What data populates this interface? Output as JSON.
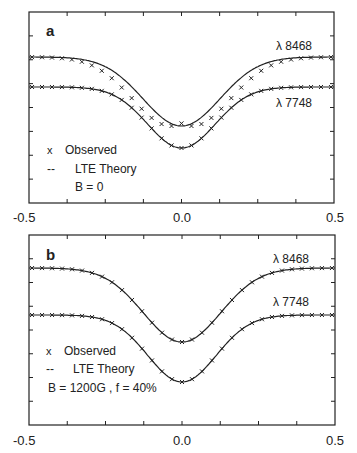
{
  "chart_data": [
    {
      "type": "line",
      "panel": "a",
      "xlim": [
        -0.5,
        0.5
      ],
      "x_ticks": [
        "-0.5",
        "0.0",
        "0.5"
      ],
      "legend": {
        "observed": "Observed",
        "theory": "LTE Theory",
        "param": "B = 0"
      },
      "series": [
        {
          "name": "λ 8468",
          "kind": "theory+observed",
          "continuum": 1.0,
          "depth": 0.36,
          "width": 0.17,
          "observed_offset": 0.04
        },
        {
          "name": "λ 7748",
          "kind": "theory+observed",
          "continuum": 1.0,
          "depth": 0.32,
          "width": 0.15,
          "observed_offset": 0.0
        }
      ],
      "notes": "Observed crosses fall left/below theory in line wings for λ 8468 with B = 0"
    },
    {
      "type": "line",
      "panel": "b",
      "xlim": [
        -0.5,
        0.5
      ],
      "x_ticks": [
        "-0.5",
        "0.0",
        "0.5"
      ],
      "legend": {
        "observed": "Observed",
        "theory": "LTE Theory",
        "param": "B = 1200G , f = 40%"
      },
      "series": [
        {
          "name": "λ 8468",
          "kind": "theory+observed",
          "continuum": 1.0,
          "depth": 0.39,
          "width": 0.17,
          "observed_offset": 0.0
        },
        {
          "name": "λ 7748",
          "kind": "theory+observed",
          "continuum": 1.0,
          "depth": 0.35,
          "width": 0.15,
          "observed_offset": 0.0
        }
      ],
      "notes": "Observed points match theory with magnetic field B = 1200G, filling factor 40%"
    }
  ],
  "panels": [
    {
      "label": "a",
      "line1": "λ 8468",
      "line2": "λ 7748",
      "legend_observed_symbol": "x",
      "legend_observed": "Observed",
      "legend_theory_symbol": "--",
      "legend_theory": "LTE Theory",
      "legend_param": "B = 0",
      "x_left": "-0.5",
      "x_mid": "0.0",
      "x_right": "0.5"
    },
    {
      "label": "b",
      "line1": "λ 8468",
      "line2": "λ 7748",
      "legend_observed_symbol": "x",
      "legend_observed": "Observed",
      "legend_theory_symbol": "--",
      "legend_theory": "LTE Theory",
      "legend_param": "B = 1200G , f = 40%",
      "x_left": "-0.5",
      "x_mid": "0.0",
      "x_right": "0.5"
    }
  ],
  "colors": {
    "ink": "#222222",
    "background": "#ffffff"
  }
}
